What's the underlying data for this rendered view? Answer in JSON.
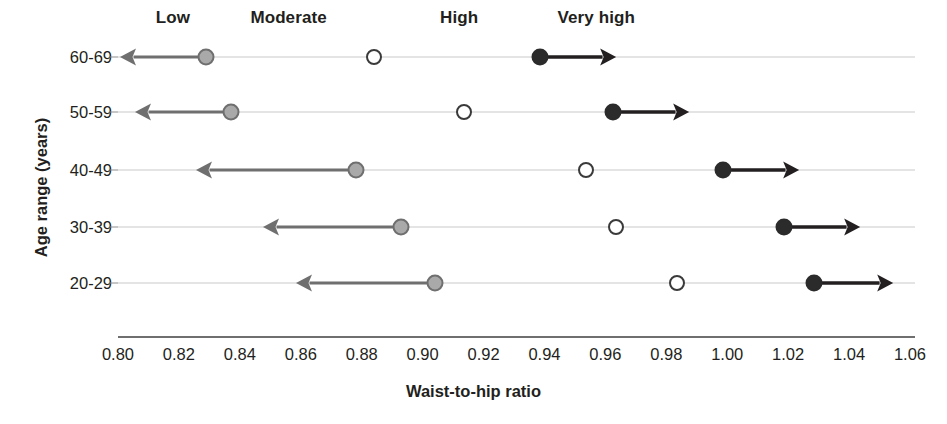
{
  "chart_data": {
    "type": "scatter",
    "title": "",
    "xlabel": "Waist-to-hip ratio",
    "ylabel": "Age range (years)",
    "xlim": [
      0.8,
      1.06
    ],
    "xticks": [
      "0.80",
      "0.82",
      "0.84",
      "0.86",
      "0.88",
      "0.90",
      "0.92",
      "0.94",
      "0.96",
      "0.98",
      "1.00",
      "1.02",
      "1.04",
      "1.06"
    ],
    "xtick_values": [
      0.8,
      0.82,
      0.84,
      0.86,
      0.88,
      0.9,
      0.92,
      0.94,
      0.96,
      0.98,
      1.0,
      1.02,
      1.04,
      1.06
    ],
    "categories": [
      "60-69",
      "50-59",
      "40-49",
      "30-39",
      "20-29"
    ],
    "grid": true,
    "legend": "none",
    "band_labels": [
      {
        "label": "Low",
        "x": 0.818
      },
      {
        "label": "Moderate",
        "x": 0.856
      },
      {
        "label": "High",
        "x": 0.912
      },
      {
        "label": "Very high",
        "x": 0.957
      }
    ],
    "series": [
      {
        "name": "Low",
        "marker": "filled-gray-circle",
        "arrow": "left",
        "color": "#a9a9a9",
        "values": [
          0.829,
          0.837,
          0.878,
          0.893,
          0.904
        ],
        "arrow_end": [
          0.8005,
          0.8055,
          0.8255,
          0.8475,
          0.8585
        ]
      },
      {
        "name": "High",
        "marker": "open-circle",
        "arrow": "none",
        "color": "#ffffff",
        "values": [
          0.884,
          0.9135,
          0.9535,
          0.9635,
          0.9835
        ],
        "arrow_end": [
          null,
          null,
          null,
          null,
          null
        ]
      },
      {
        "name": "Very high",
        "marker": "filled-black-circle",
        "arrow": "right",
        "color": "#2b2b2b",
        "values": [
          0.9385,
          0.9625,
          0.9985,
          1.0185,
          1.0285
        ],
        "arrow_end": [
          0.9635,
          0.9875,
          1.0235,
          1.0435,
          1.0545
        ]
      }
    ]
  },
  "axis": {
    "y_title": "Age range (years)",
    "x_title": "Waist-to-hip ratio"
  }
}
